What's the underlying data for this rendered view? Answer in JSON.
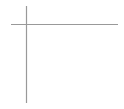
{
  "diagram": {
    "type": "dot-grid",
    "top_row": {
      "count": 5,
      "color": "#000000"
    },
    "grid": {
      "rows": 5,
      "columns": 5,
      "color": "#333333"
    },
    "line_color": "#999999"
  }
}
